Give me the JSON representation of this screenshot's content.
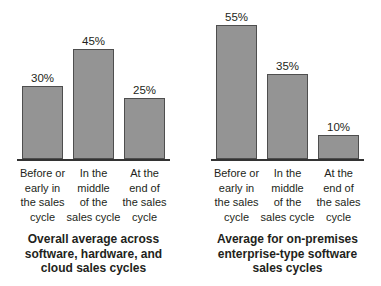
{
  "style": {
    "bar_fill": "#949494",
    "bar_border": "#4e4e4e",
    "axis_color": "#333333",
    "text_color": "#231f20",
    "background": "#ffffff",
    "px_per_percent": 2.44
  },
  "chart_data": [
    {
      "type": "bar",
      "title": "Overall average across software, hardware, and cloud sales cycles",
      "title_lines": [
        "Overall average across",
        "software, hardware, and",
        "cloud sales cycles"
      ],
      "categories": [
        "Before or early in the sales cycle",
        "In the middle of the sales cycle",
        "At the end of the sales cycle"
      ],
      "category_lines": [
        [
          "Before or",
          "early in",
          "the sales",
          "cycle"
        ],
        [
          "In the",
          "middle",
          "of the",
          "sales cycle"
        ],
        [
          "At the",
          "end of",
          "the sales",
          "cycle"
        ]
      ],
      "values": [
        30,
        45,
        25
      ],
      "value_labels": [
        "30%",
        "45%",
        "25%"
      ],
      "xlabel": "",
      "ylabel": "",
      "ylim": [
        0,
        65
      ],
      "grid": false,
      "legend": false
    },
    {
      "type": "bar",
      "title": "Average for on-premises enterprise-type software sales cycles",
      "title_lines": [
        "Average for on-premises",
        "enterprise-type software",
        "sales cycles"
      ],
      "categories": [
        "Before or early in the sales cycle",
        "In the middle of the sales cycle",
        "At the end of the sales cycle"
      ],
      "category_lines": [
        [
          "Before or",
          "early in",
          "the sales",
          "cycle"
        ],
        [
          "In the",
          "middle",
          "of the",
          "sales cycle"
        ],
        [
          "At the",
          "end of",
          "the sales",
          "cycle"
        ]
      ],
      "values": [
        55,
        35,
        10
      ],
      "value_labels": [
        "55%",
        "35%",
        "10%"
      ],
      "xlabel": "",
      "ylabel": "",
      "ylim": [
        0,
        65
      ],
      "grid": false,
      "legend": false
    }
  ]
}
